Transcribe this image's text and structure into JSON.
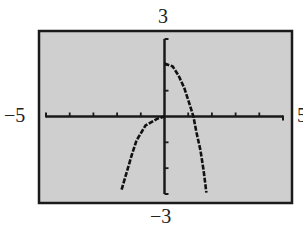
{
  "window": {
    "xmin_label": "−5",
    "xmax_label": "5",
    "ymax_label": "3",
    "ymin_label": "−3"
  },
  "colors": {
    "screen_bg": "#cfcfcf",
    "frame": "#1a1a1a",
    "axis": "#1a1a1a",
    "curve": "#111111",
    "page_bg": "#ffffff"
  },
  "chart_data": {
    "type": "line",
    "title": "",
    "xlabel": "",
    "ylabel": "",
    "xlim": [
      -5,
      5
    ],
    "ylim": [
      -3,
      3
    ],
    "xscl": 1,
    "yscl": 1,
    "grid": false,
    "legend": null,
    "tick_labels": {
      "x_min": "−5",
      "x_max": "5",
      "y_min": "−3",
      "y_max": "3"
    },
    "x_ticks": [
      -4,
      -3,
      -2,
      -1,
      1,
      2,
      3,
      4
    ],
    "y_ticks": [
      -2,
      -1,
      1,
      2
    ],
    "series": [
      {
        "name": "left-branch",
        "style": "dotted-pixel",
        "points": [
          [
            -1.81,
            -2.83
          ],
          [
            -1.6,
            -2.17
          ],
          [
            -1.39,
            -1.51
          ],
          [
            -1.18,
            -0.93
          ],
          [
            -0.8,
            -0.35
          ],
          [
            -0.3,
            -0.08
          ],
          [
            0.0,
            0.0
          ]
        ]
      },
      {
        "name": "right-branch",
        "style": "dotted-pixel",
        "points": [
          [
            0.0,
            2.05
          ],
          [
            0.34,
            1.94
          ],
          [
            0.59,
            1.59
          ],
          [
            0.84,
            1.09
          ],
          [
            1.05,
            0.5
          ],
          [
            1.22,
            0.0
          ],
          [
            1.35,
            -0.62
          ],
          [
            1.52,
            -1.32
          ],
          [
            1.65,
            -2.09
          ],
          [
            1.77,
            -2.95
          ]
        ]
      }
    ]
  }
}
